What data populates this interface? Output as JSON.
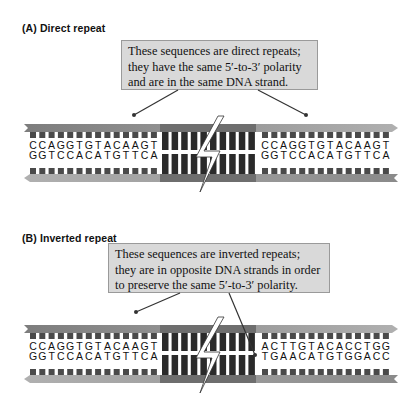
{
  "panels": [
    {
      "id": "A",
      "label": "(A)  Direct repeat",
      "callout": {
        "lines": [
          "These sequences are direct repeats;",
          "they have the same 5′-to-3′ polarity",
          "and are in the same DNA strand."
        ]
      },
      "left_repeat": {
        "top": "CCAGGTGTACAAGT",
        "bottom": "GGTCCACATGTTCA"
      },
      "right_repeat": {
        "top": "CCAGGTGTACAAGT",
        "bottom": "GGTCCACATGTTCA"
      }
    },
    {
      "id": "B",
      "label": "(B)  Inverted repeat",
      "callout": {
        "lines": [
          "These sequences are inverted repeats;",
          "they are in opposite DNA strands in order",
          "to preserve the same 5′-to-3′ polarity."
        ]
      },
      "left_repeat": {
        "top": "CCAGGTGTACAAGT",
        "bottom": "GGTCCACATGTTCA"
      },
      "right_repeat": {
        "top": "ACTTGTACACCTGG",
        "bottom": "TGAACATGTGGACC"
      }
    }
  ],
  "colors": {
    "callout_fill": "#d9d9d9",
    "backbone_light": "#a8a8a8",
    "backbone_mid": "#8a8a8a",
    "backbone_dark": "#6e6e6e",
    "base_block": "#4a4a4a",
    "spacer_block": "#2a2a2a",
    "pointer_line": "#333333"
  }
}
